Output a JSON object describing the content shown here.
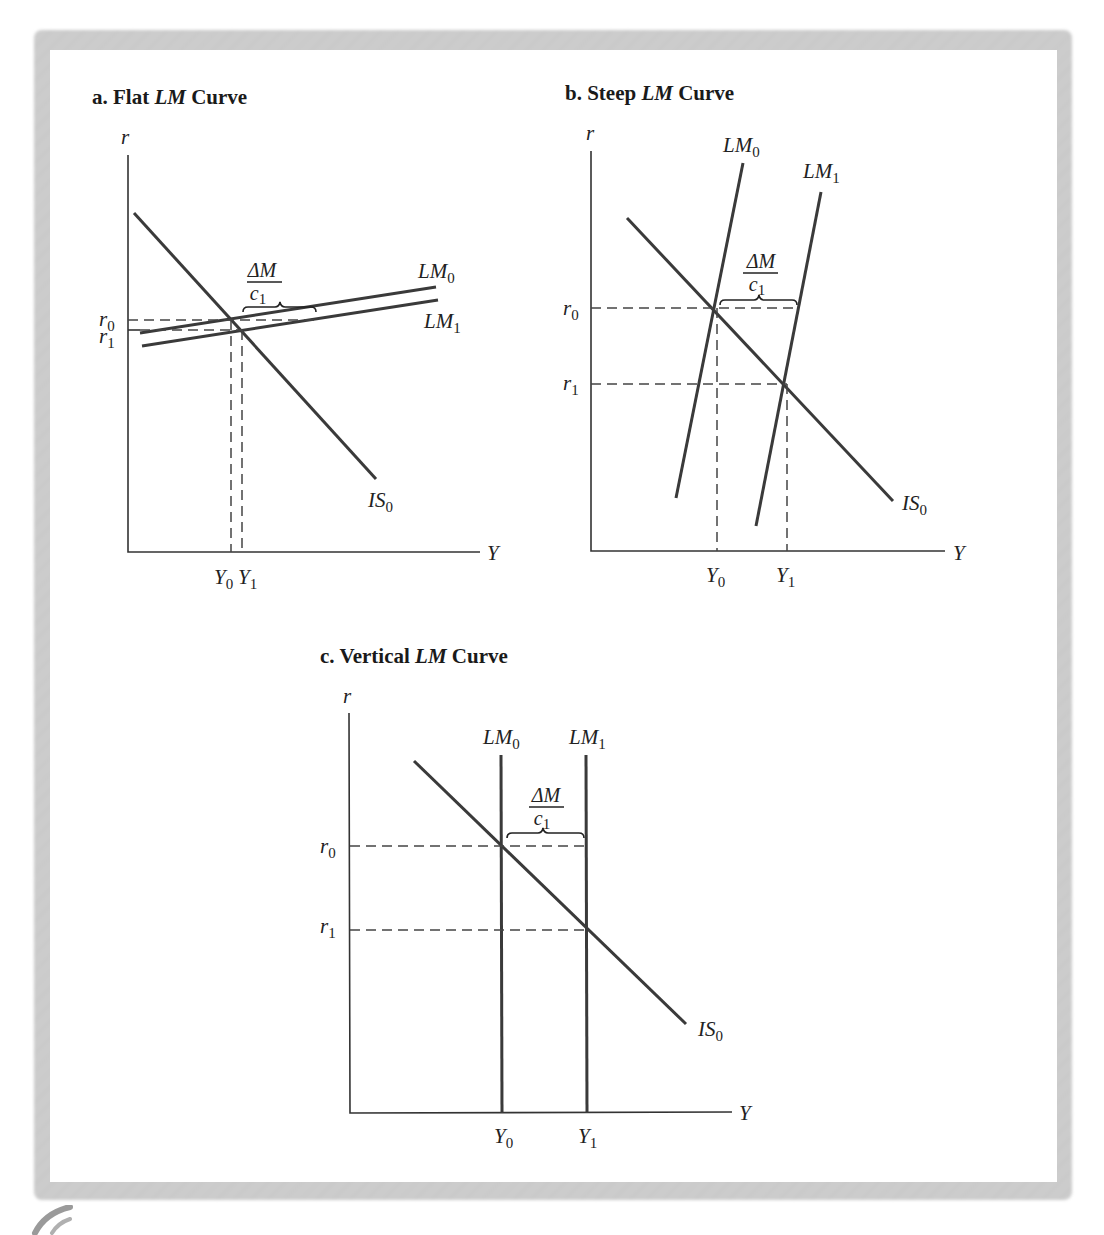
{
  "figure": {
    "panels": [
      {
        "id": "a",
        "title_prefix": "a.  Flat ",
        "title_italic": "LM",
        "title_suffix": " Curve",
        "y_axis_label": "r",
        "x_axis_label": "Y",
        "curves": [
          {
            "name": "IS",
            "sub": "0"
          },
          {
            "name": "LM",
            "sub": "0"
          },
          {
            "name": "LM",
            "sub": "1"
          }
        ],
        "y_ticks": [
          {
            "name": "r",
            "sub": "0"
          },
          {
            "name": "r",
            "sub": "1"
          }
        ],
        "x_ticks": [
          {
            "name": "Y",
            "sub": "0"
          },
          {
            "name": "Y",
            "sub": "1"
          }
        ],
        "shift_label": {
          "numerator": "ΔM",
          "denominator_name": "c",
          "denominator_sub": "1"
        }
      },
      {
        "id": "b",
        "title_prefix": "b.  Steep ",
        "title_italic": "LM",
        "title_suffix": " Curve",
        "y_axis_label": "r",
        "x_axis_label": "Y",
        "curves": [
          {
            "name": "IS",
            "sub": "0"
          },
          {
            "name": "LM",
            "sub": "0"
          },
          {
            "name": "LM",
            "sub": "1"
          }
        ],
        "y_ticks": [
          {
            "name": "r",
            "sub": "0"
          },
          {
            "name": "r",
            "sub": "1"
          }
        ],
        "x_ticks": [
          {
            "name": "Y",
            "sub": "0"
          },
          {
            "name": "Y",
            "sub": "1"
          }
        ],
        "shift_label": {
          "numerator": "ΔM",
          "denominator_name": "c",
          "denominator_sub": "1"
        }
      },
      {
        "id": "c",
        "title_prefix": "c.  Vertical ",
        "title_italic": "LM",
        "title_suffix": " Curve",
        "y_axis_label": "r",
        "x_axis_label": "Y",
        "curves": [
          {
            "name": "IS",
            "sub": "0"
          },
          {
            "name": "LM",
            "sub": "0"
          },
          {
            "name": "LM",
            "sub": "1"
          }
        ],
        "y_ticks": [
          {
            "name": "r",
            "sub": "0"
          },
          {
            "name": "r",
            "sub": "1"
          }
        ],
        "x_ticks": [
          {
            "name": "Y",
            "sub": "0"
          },
          {
            "name": "Y",
            "sub": "1"
          }
        ],
        "shift_label": {
          "numerator": "ΔM",
          "denominator_name": "c",
          "denominator_sub": "1"
        }
      }
    ]
  }
}
